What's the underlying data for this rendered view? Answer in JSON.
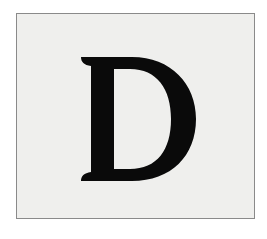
{
  "card": {
    "letter": "D",
    "background_color": "#efefed",
    "border_color": "#8a8a8a",
    "letter_color": "#0a0a0a"
  }
}
